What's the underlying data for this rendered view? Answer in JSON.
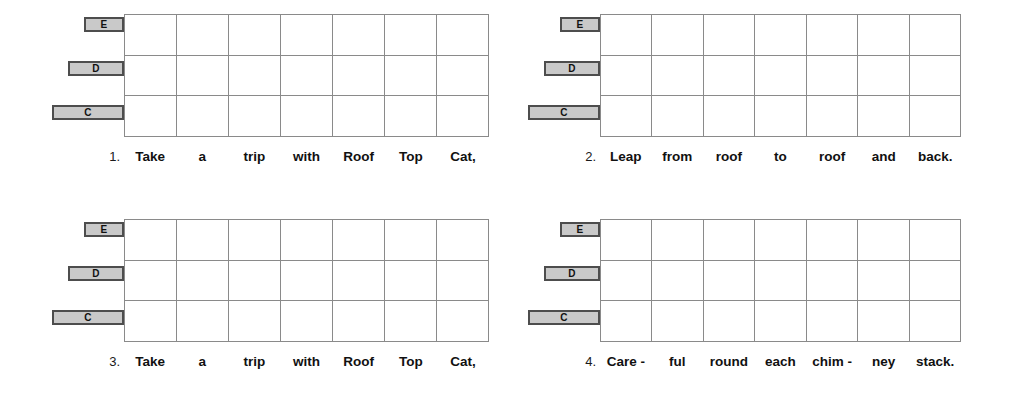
{
  "page": {
    "background": "#ffffff",
    "grid_line_color": "#8a8a8a",
    "pill_fill": "#c9c9c9",
    "pill_border": "#4d4d4d",
    "text_color": "#111111"
  },
  "note_labels": {
    "top": "E",
    "middle": "D",
    "bottom": "C"
  },
  "grid": {
    "columns": 7,
    "rows": 3
  },
  "panels": [
    {
      "number": "1.",
      "note_labels": {
        "top": "E",
        "middle": "D",
        "bottom": "C"
      },
      "syllables": [
        "Take",
        "a",
        "trip",
        "with",
        "Roof",
        "Top",
        "Cat,"
      ]
    },
    {
      "number": "2.",
      "note_labels": {
        "top": "E",
        "middle": "D",
        "bottom": "C"
      },
      "syllables": [
        "Leap",
        "from",
        "roof",
        "to",
        "roof",
        "and",
        "back."
      ]
    },
    {
      "number": "3.",
      "note_labels": {
        "top": "E",
        "middle": "D",
        "bottom": "C"
      },
      "syllables": [
        "Take",
        "a",
        "trip",
        "with",
        "Roof",
        "Top",
        "Cat,"
      ]
    },
    {
      "number": "4.",
      "note_labels": {
        "top": "E",
        "middle": "D",
        "bottom": "C"
      },
      "syllables": [
        "Care -",
        "ful",
        "round",
        "each",
        "chim -",
        "ney",
        "stack."
      ]
    }
  ]
}
